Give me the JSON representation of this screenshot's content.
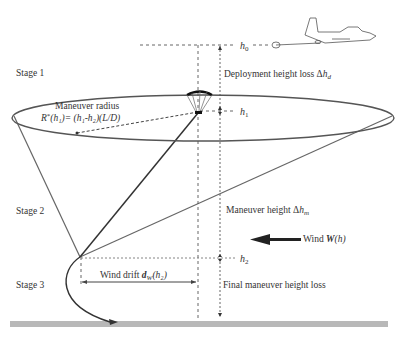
{
  "stages": {
    "stage1": "Stage 1",
    "stage2": "Stage 2",
    "stage3": "Stage 3"
  },
  "labels": {
    "h0": "h",
    "h0_sub": "0",
    "h1": "h",
    "h1_sub": "1",
    "h2": "h",
    "h2_sub": "2",
    "deployment_prefix": "Deployment height loss Δ",
    "deployment_var": "h",
    "deployment_sub": "d",
    "maneuver_radius_title": "Maneuver radius",
    "maneuver_radius_formula_R": "R",
    "maneuver_radius_formula_star": "*",
    "maneuver_radius_formula_rest": "(h₁)= (h₁-h₂)(L/D)",
    "maneuver_height_prefix": "Maneuver height Δ",
    "maneuver_height_var": "h",
    "maneuver_height_sub": "m",
    "wind_prefix": "Wind ",
    "wind_var": "W",
    "wind_suffix": "(h)",
    "wind_drift_prefix": "Wind drift ",
    "wind_drift_var": "d",
    "wind_drift_sub": "W",
    "wind_drift_suffix": "(h₂)",
    "final_maneuver": "Final maneuver height loss"
  },
  "colors": {
    "line": "#555555",
    "ground": "#b8b8b8",
    "text": "#333333"
  }
}
